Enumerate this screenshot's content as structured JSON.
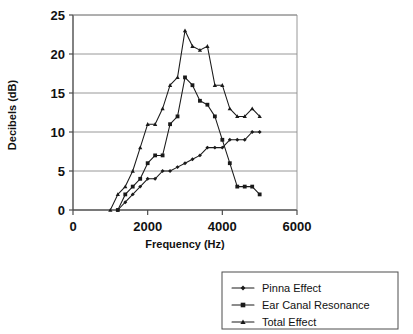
{
  "chart_data": {
    "type": "line",
    "title": "",
    "xlabel": "Frequency (Hz)",
    "ylabel": "Decibels (dB)",
    "xlim": [
      0,
      6000
    ],
    "ylim": [
      0,
      25
    ],
    "xticks": [
      0,
      2000,
      4000,
      6000
    ],
    "xtick_labels": [
      "0",
      "2000",
      "4000",
      "6000"
    ],
    "yticks": [
      0,
      5,
      10,
      15,
      20,
      25
    ],
    "ytick_labels": [
      "0",
      "5",
      "10",
      "15",
      "20",
      "25"
    ],
    "grid": "horizontal",
    "legend_position": "bottom-right",
    "series": [
      {
        "name": "Pinna Effect",
        "marker": "diamond",
        "x": [
          1200,
          1400,
          1600,
          1800,
          2000,
          2200,
          2400,
          2600,
          2800,
          3000,
          3200,
          3400,
          3600,
          3800,
          4000,
          4200,
          4400,
          4600,
          4800,
          5000
        ],
        "y": [
          0,
          1,
          2,
          3,
          4,
          4,
          5,
          5,
          5.5,
          6,
          6.5,
          7,
          8,
          8,
          8,
          9,
          9,
          9,
          10,
          10
        ]
      },
      {
        "name": "Ear Canal Resonance",
        "marker": "square",
        "x": [
          1200,
          1400,
          1600,
          1800,
          2000,
          2200,
          2400,
          2600,
          2800,
          3000,
          3200,
          3400,
          3600,
          3800,
          4000,
          4200,
          4400,
          4600,
          4800,
          5000
        ],
        "y": [
          0,
          2,
          3,
          4,
          6,
          7,
          7,
          11,
          12,
          17,
          16,
          14,
          13.5,
          12,
          9,
          6,
          3,
          3,
          3,
          2
        ]
      },
      {
        "name": "Total Effect",
        "marker": "triangle",
        "x": [
          1000,
          1200,
          1400,
          1600,
          1800,
          2000,
          2200,
          2400,
          2600,
          2800,
          3000,
          3200,
          3400,
          3600,
          3800,
          4000,
          4200,
          4400,
          4600,
          4800,
          5000
        ],
        "y": [
          0,
          2,
          3,
          5,
          8,
          11,
          11,
          13,
          16,
          17,
          23,
          21,
          20.5,
          21,
          16,
          16,
          13,
          12,
          12,
          13,
          12
        ]
      }
    ]
  },
  "legend": {
    "items": [
      {
        "label": "Pinna Effect"
      },
      {
        "label": "Ear Canal Resonance"
      },
      {
        "label": "Total Effect"
      }
    ]
  }
}
